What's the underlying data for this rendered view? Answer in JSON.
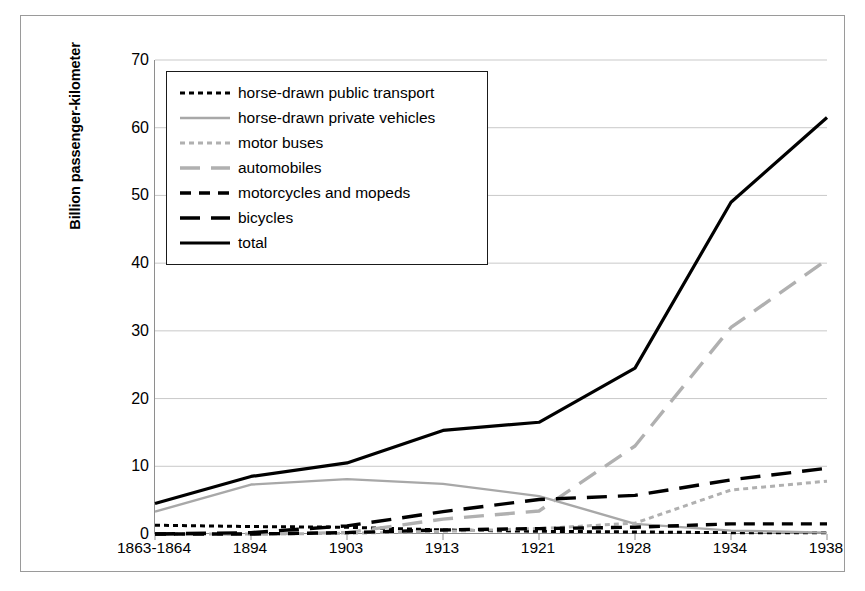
{
  "chart_data": {
    "type": "line",
    "title": "",
    "xlabel": "",
    "ylabel": "Billion passenger-kilometer",
    "categories": [
      "1863-1864",
      "1894",
      "1903",
      "1913",
      "1921",
      "1928",
      "1934",
      "1938"
    ],
    "ylim": [
      0,
      70
    ],
    "ytick_step": 10,
    "yticks": [
      "70",
      "60",
      "50",
      "40",
      "30",
      "20",
      "10",
      "0"
    ],
    "grid": "horizontal",
    "legend_position": "top-left-inside",
    "series": [
      {
        "name": "horse-drawn public transport",
        "color": "#000000",
        "style": "dotted",
        "values": [
          1.3,
          1.1,
          1.0,
          0.6,
          0.4,
          0.3,
          0.2,
          0.2
        ]
      },
      {
        "name": "horse-drawn private vehicles",
        "color": "#a8a8a8",
        "style": "solid",
        "values": [
          3.3,
          7.3,
          8.1,
          7.4,
          5.6,
          1.5,
          0.5,
          0.2
        ]
      },
      {
        "name": "motor buses",
        "color": "#b0b0b0",
        "style": "dotted",
        "values": [
          0.0,
          0.0,
          0.1,
          0.4,
          0.8,
          1.6,
          6.5,
          7.8
        ]
      },
      {
        "name": "automobiles",
        "color": "#b0b0b0",
        "style": "dashed-long",
        "values": [
          0.0,
          0.0,
          0.2,
          2.2,
          3.4,
          13.0,
          30.5,
          40.5
        ]
      },
      {
        "name": "motorcycles and mopeds",
        "color": "#000000",
        "style": "dashed-short",
        "values": [
          0.0,
          0.0,
          0.2,
          0.6,
          0.8,
          1.0,
          1.5,
          1.5
        ]
      },
      {
        "name": "bicycles",
        "color": "#000000",
        "style": "dashed-long",
        "values": [
          0.0,
          0.2,
          1.2,
          3.3,
          5.1,
          5.7,
          8.0,
          9.7
        ]
      },
      {
        "name": "total",
        "color": "#000000",
        "style": "solid-thick",
        "values": [
          4.5,
          8.5,
          10.5,
          15.3,
          16.5,
          24.5,
          49.0,
          61.5
        ]
      }
    ]
  }
}
